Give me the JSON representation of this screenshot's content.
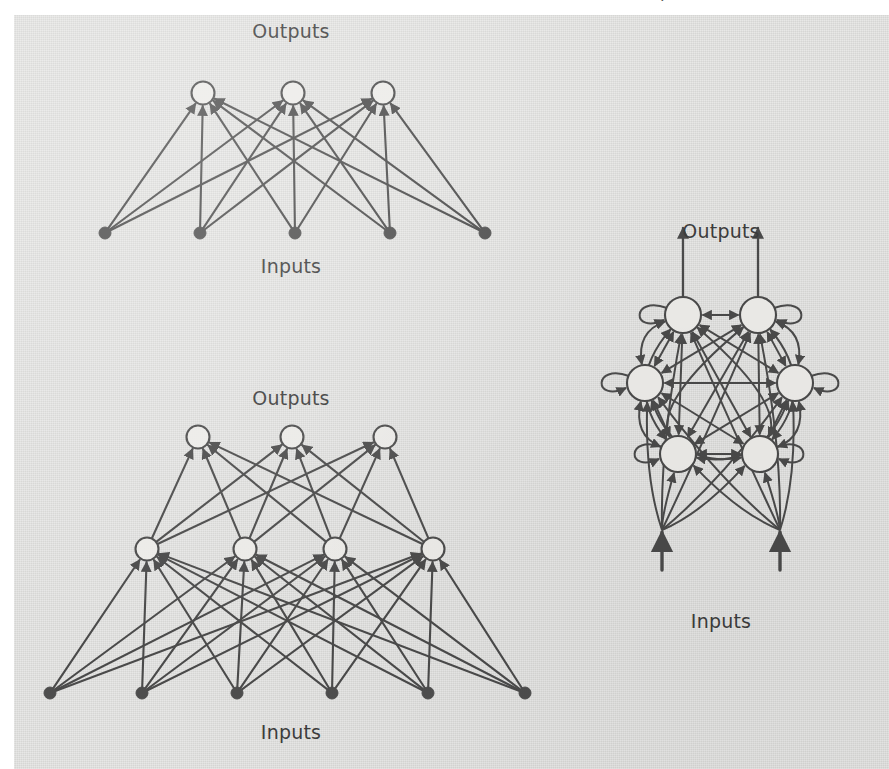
{
  "figure": {
    "title_fragment": "p",
    "background_color": "#d6d6d4",
    "ink_color": "#4a4a4a",
    "node_fill_light": "#ecebe8",
    "node_fill_dark": "#4d4d4d",
    "diagrams": [
      {
        "id": "single-layer-perceptron",
        "name": "single-layer-feedforward-network",
        "output_label": "Outputs",
        "input_label": "Inputs",
        "layers": [
          {
            "role": "input",
            "count": 5,
            "style": "filled-dot",
            "y": 233,
            "xs": [
              105,
              200,
              295,
              390,
              485
            ]
          },
          {
            "role": "output",
            "count": 3,
            "style": "open-circle",
            "y": 93,
            "xs": [
              203,
              293,
              383
            ]
          }
        ],
        "connections": "fully-connected-input-to-output",
        "edge_count": 15,
        "arrow_direction": "upward-into-outputs"
      },
      {
        "id": "multilayer-perceptron",
        "name": "multilayer-feedforward-network",
        "output_label": "Outputs",
        "input_label": "Inputs",
        "layers": [
          {
            "role": "input",
            "count": 6,
            "style": "filled-dot",
            "y": 693,
            "xs": [
              50,
              142,
              237,
              332,
              428,
              525
            ]
          },
          {
            "role": "hidden",
            "count": 4,
            "style": "open-circle",
            "y": 549,
            "xs": [
              147,
              245,
              335,
              433
            ]
          },
          {
            "role": "output",
            "count": 3,
            "style": "open-circle",
            "y": 437,
            "xs": [
              198,
              292,
              385
            ]
          }
        ],
        "connections": "fully-connected-between-adjacent-layers",
        "edge_count": 36,
        "arrow_direction": "upward-feedforward"
      },
      {
        "id": "recurrent-network",
        "name": "fully-recurrent-network",
        "output_label": "Outputs",
        "input_label": "Inputs",
        "node_count": 6,
        "node_style": "open-circle",
        "nodes": [
          {
            "index": 0,
            "x": 683,
            "y": 315,
            "self_loop": true,
            "self_loop_dir": "left"
          },
          {
            "index": 1,
            "x": 758,
            "y": 315,
            "self_loop": true,
            "self_loop_dir": "right"
          },
          {
            "index": 2,
            "x": 645,
            "y": 383,
            "self_loop": true,
            "self_loop_dir": "left"
          },
          {
            "index": 3,
            "x": 795,
            "y": 383,
            "self_loop": true,
            "self_loop_dir": "right"
          },
          {
            "index": 4,
            "x": 678,
            "y": 454,
            "self_loop": true,
            "self_loop_dir": "left"
          },
          {
            "index": 5,
            "x": 760,
            "y": 454,
            "self_loop": true,
            "self_loop_dir": "right"
          }
        ],
        "connections": "all-pairs-bidirectional-plus-self-loops",
        "input_arrows": 2,
        "output_arrows": 2,
        "input_hub_points": [
          [
            662,
            530
          ],
          [
            780,
            530
          ]
        ],
        "output_arrow_tops": [
          [
            683,
            228
          ],
          [
            758,
            228
          ]
        ]
      }
    ],
    "labels": [
      {
        "id": "tl-outputs",
        "text": "Outputs",
        "x": 291,
        "y": 38,
        "anchor": "middle"
      },
      {
        "id": "tl-inputs",
        "text": "Inputs",
        "x": 291,
        "y": 273,
        "anchor": "middle"
      },
      {
        "id": "bl-outputs",
        "text": "Outputs",
        "x": 291,
        "y": 405,
        "anchor": "middle"
      },
      {
        "id": "bl-inputs",
        "text": "Inputs",
        "x": 291,
        "y": 739,
        "anchor": "middle"
      },
      {
        "id": "r-outputs",
        "text": "Outputs",
        "x": 721,
        "y": 238,
        "anchor": "middle"
      },
      {
        "id": "r-inputs",
        "text": "Inputs",
        "x": 721,
        "y": 628,
        "anchor": "middle"
      }
    ]
  }
}
